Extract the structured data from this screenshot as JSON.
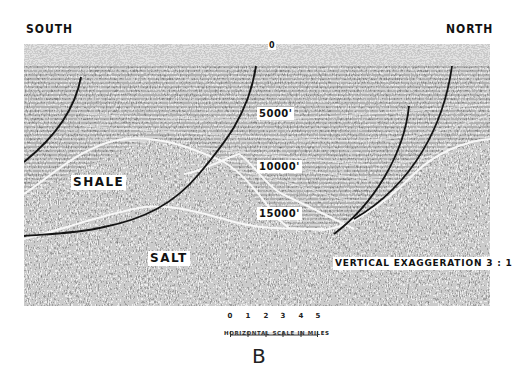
{
  "figure": {
    "panel_letter": "B",
    "direction_left": "SOUTH",
    "direction_right": "NORTH",
    "surface_marker": "0",
    "depth_labels": [
      "5000'",
      "10000'",
      "15000'"
    ],
    "unit_labels": {
      "upper": "SHALE",
      "lower": "SALT"
    },
    "vertical_exaggeration": "VERTICAL EXAGGERATION 3 : 1",
    "scale_bar": {
      "ticks": [
        "0",
        "1",
        "2",
        "3",
        "4",
        "5"
      ],
      "caption": "HORIZONTAL SCALE IN MILES"
    },
    "colors": {
      "background": "#ffffff",
      "seismic_dark": "#3a3a3a",
      "seismic_light": "#bdbdbd",
      "horizon": "#f4f4f4",
      "fault": "#151515"
    }
  }
}
